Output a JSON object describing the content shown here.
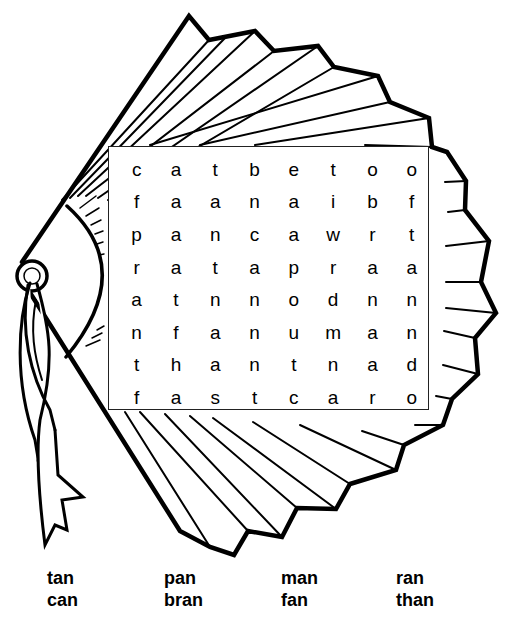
{
  "puzzle": {
    "title": "",
    "grid": [
      [
        "c",
        "a",
        "t",
        "b",
        "e",
        "t",
        "o",
        "o"
      ],
      [
        "f",
        "a",
        "a",
        "n",
        "a",
        "i",
        "b",
        "f"
      ],
      [
        "p",
        "a",
        "n",
        "c",
        "a",
        "w",
        "r",
        "t"
      ],
      [
        "r",
        "a",
        "t",
        "a",
        "p",
        "r",
        "a",
        "a"
      ],
      [
        "a",
        "t",
        "n",
        "n",
        "o",
        "d",
        "n",
        "n"
      ],
      [
        "n",
        "f",
        "a",
        "n",
        "u",
        "m",
        "a",
        "n"
      ],
      [
        "t",
        "h",
        "a",
        "n",
        "t",
        "n",
        "a",
        "d"
      ],
      [
        "f",
        "a",
        "s",
        "t",
        "c",
        "a",
        "r",
        "o"
      ]
    ]
  },
  "word_list": {
    "words": [
      "tan",
      "pan",
      "man",
      "ran",
      "can",
      "bran",
      "fan",
      "than"
    ]
  },
  "illustration": {
    "subject": "folding-fan-with-ribbon",
    "stroke_color": "#000000",
    "fill_color": "#ffffff"
  }
}
